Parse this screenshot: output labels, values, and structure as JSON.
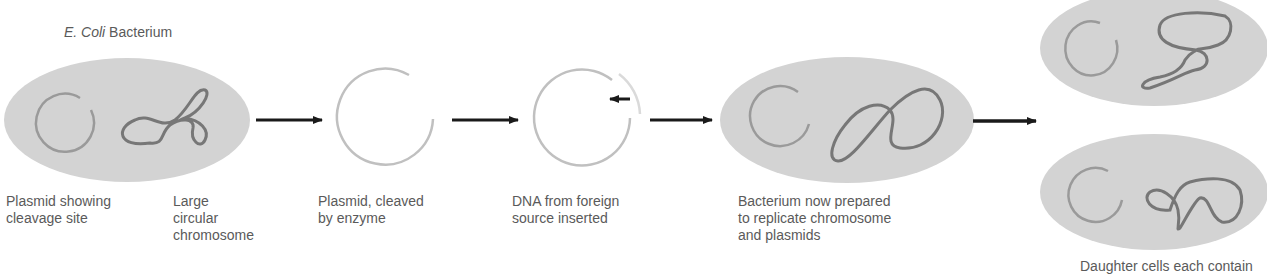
{
  "title": {
    "italic": "E. Coli",
    "rest": " Bacterium"
  },
  "steps": [
    {
      "id": "ecoli-bacterium",
      "labels": [
        "Plasmid showing\ncleavage site",
        "Large\ncircular\nchromosome"
      ]
    },
    {
      "id": "cleaved-plasmid",
      "label": "Plasmid, cleaved\nby enzyme"
    },
    {
      "id": "foreign-dna-inserted",
      "label": "DNA from foreign\nsource inserted"
    },
    {
      "id": "prepared-bacterium",
      "label": "Bacterium now prepared\nto replicate chromosome\nand plasmids"
    },
    {
      "id": "daughter-cells",
      "label": "Daughter cells each contain"
    }
  ],
  "colors": {
    "cell_fill": "#d3d3d3",
    "plasmid": "#9a9a9a",
    "plasmid_light": "#c4c4c4",
    "chromosome": "#777777",
    "arrow": "#1a1a1a",
    "text": "#5a5a5a"
  }
}
